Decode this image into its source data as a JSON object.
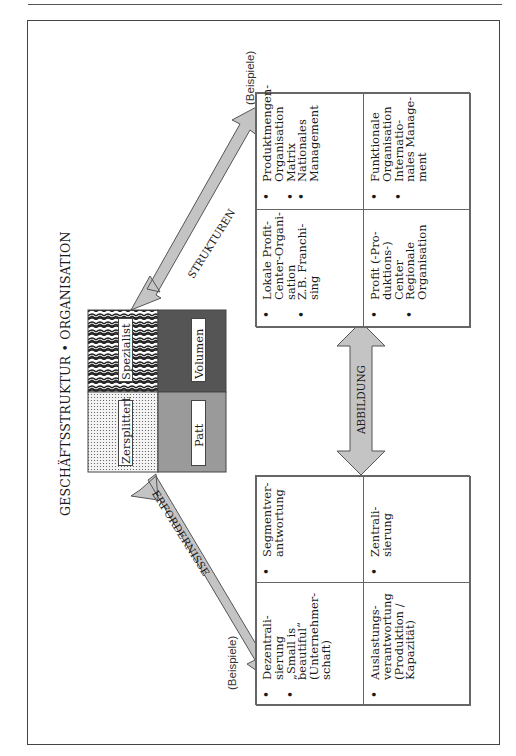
{
  "title": "GESCHÄFTSSTRUKTUR • ORGANISATION",
  "matrix": {
    "cells": [
      {
        "label": "Zersplittert",
        "pattern": "dots",
        "color": "#e8e8e8"
      },
      {
        "label": "Spezialist",
        "pattern": "scales",
        "color": "#3a3a3a"
      },
      {
        "label": "Patt",
        "pattern": "solid",
        "color": "#9a9a9a"
      },
      {
        "label": "Volumen",
        "pattern": "solid",
        "color": "#555555"
      }
    ]
  },
  "arrows": {
    "left": {
      "label": "ERFORDERNISSE"
    },
    "right": {
      "label": "STRUKTUREN"
    },
    "middle": {
      "label": "ABBILDUNG"
    },
    "color": "#c4c4c4"
  },
  "left_box": {
    "caption": "(Beispiele)",
    "cells": [
      {
        "items": [
          "Dezentrali-\nsierung",
          "„Small is\nbeautiful“\n(Unternehmer-\nschaft)"
        ]
      },
      {
        "items": [
          "Segmentver-\nantwortung"
        ]
      },
      {
        "items": [
          "Auslastungs-\nverantwortung\n(Produktion /\nKapazität)"
        ]
      },
      {
        "items": [
          "Zentrali-\nsierung"
        ]
      }
    ]
  },
  "right_box": {
    "caption": "(Beispiele)",
    "cells": [
      {
        "items": [
          "Lokale Profit-\nCenter-Organi-\nsation",
          "Z.B. Franchi-\nsing"
        ]
      },
      {
        "items": [
          "Produktmengen-\nOrganisation",
          "Matrix",
          "Nationales\nManagement"
        ]
      },
      {
        "items": [
          "Profit (-Pro-\nduktions-)\nCenter",
          "Regionale\nOrganisation"
        ]
      },
      {
        "items": [
          "Funktionale\nOrganisation",
          "Internatio-\nnales Manage-\nment"
        ]
      }
    ]
  }
}
